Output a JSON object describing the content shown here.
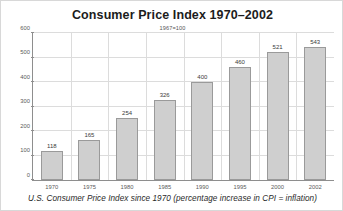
{
  "chart_data": {
    "type": "bar",
    "title": "Consumer Price Index 1970–2002",
    "subtitle": "1967=100",
    "caption": "U.S. Consumer Price Index since 1970 (percentage increase in CPI = inflation)",
    "categories": [
      "1970",
      "1975",
      "1980",
      "1985",
      "1990",
      "1995",
      "2000",
      "2002"
    ],
    "values": [
      118,
      165,
      254,
      326,
      400,
      460,
      521,
      543
    ],
    "xlabel": "",
    "ylabel": "",
    "ylim": [
      0,
      600
    ],
    "yticks": [
      0,
      100,
      200,
      300,
      400,
      500,
      600
    ],
    "grid": true,
    "legend": "none",
    "bar_fill_color": "#cfcfcf",
    "bar_border_color": "#9a9a9a",
    "axis_color": "#8e8e8e",
    "grid_color": "#dcdcdc"
  }
}
